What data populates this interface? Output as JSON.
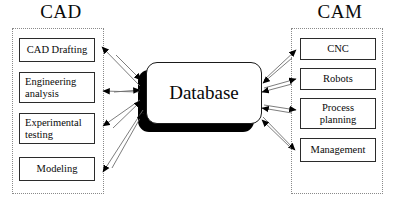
{
  "diagram": {
    "title_left": "CAD",
    "title_right": "CAM",
    "center": {
      "label": "Database",
      "shape": "rounded-rectangle-with-shadow"
    },
    "left_group": {
      "name": "CAD",
      "items": [
        {
          "label": "CAD Drafting"
        },
        {
          "label": "Engineering analysis"
        },
        {
          "label": "Experimental testing"
        },
        {
          "label": "Modeling"
        }
      ]
    },
    "right_group": {
      "name": "CAM",
      "items": [
        {
          "label": "CNC"
        },
        {
          "label": "Robots"
        },
        {
          "label": "Process planning"
        },
        {
          "label": "Management"
        }
      ]
    },
    "colors": {
      "background": "#ffffff",
      "box_border": "#2b2b2b",
      "container_border": "#8a8a8a",
      "connector": "#6e6e6e",
      "arrowhead": "#000000",
      "shadow": "#000000",
      "text": "#0a0a0a"
    },
    "connectors": {
      "style": "bidirectional",
      "description": "Each CAD item and each CAM item exchanges arrows with the central Database"
    }
  }
}
